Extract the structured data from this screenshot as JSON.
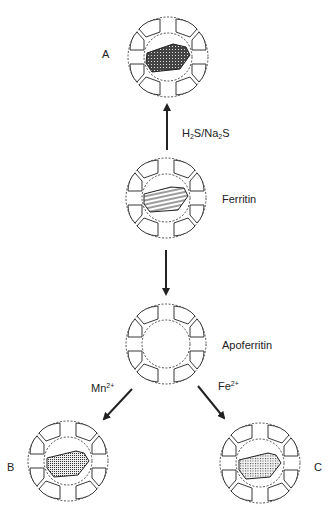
{
  "diagram": {
    "colors": {
      "line": "#222222",
      "background": "#ffffff",
      "core_fill": "#555555"
    },
    "nodes": [
      {
        "id": "A",
        "label": "A",
        "cx": 168,
        "cy": 57,
        "core": "sulfide-crosshatch"
      },
      {
        "id": "ferritin",
        "label": "Ferritin",
        "cx": 166,
        "cy": 198,
        "core": "striped"
      },
      {
        "id": "apoferritin",
        "label": "Apoferritin",
        "cx": 166,
        "cy": 344,
        "core": "empty"
      },
      {
        "id": "B",
        "label": "B",
        "cx": 68,
        "cy": 461,
        "core": "stippled-dense"
      },
      {
        "id": "C",
        "label": "C",
        "cx": 260,
        "cy": 463,
        "core": "stippled-light"
      }
    ],
    "edges": [
      {
        "from": "ferritin",
        "to": "A",
        "reagent": {
          "pre": "H",
          "sub1": "2",
          "mid": "S/Na",
          "sub2": "2",
          "post": "S"
        }
      },
      {
        "from": "ferritin",
        "to": "apoferritin",
        "reagent": null
      },
      {
        "from": "apoferritin",
        "to": "B",
        "reagent": {
          "base": "Mn",
          "sup": "2+"
        }
      },
      {
        "from": "apoferritin",
        "to": "C",
        "reagent": {
          "base": "Fe",
          "sup": "2+"
        }
      }
    ]
  },
  "labels": {
    "a": "A",
    "ferritin": "Ferritin",
    "apoferritin": "Apoferritin",
    "b": "B",
    "c": "C",
    "h2s": {
      "pre": "H",
      "sub1": "2",
      "mid": "S/Na",
      "sub2": "2",
      "post": "S"
    },
    "mn": {
      "base": "Mn",
      "sup": "2+"
    },
    "fe": {
      "base": "Fe",
      "sup": "2+"
    }
  }
}
